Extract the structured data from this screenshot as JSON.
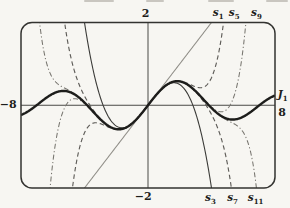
{
  "figure": {
    "caption_hint": "Bessel function J1 and its polynomial approximations",
    "colors": {
      "paper": "#f7f6f2",
      "frame": "#333330",
      "axis": "#4a4a47",
      "ink": "#1d1d1b",
      "thin_ink": "#3b3b38",
      "mid_ink": "#5f5d59",
      "dashdot_ink": "#77756f",
      "light_ink": "#908e88"
    }
  },
  "chart_data": {
    "type": "line",
    "xlabel": "",
    "ylabel": "",
    "x_range": [
      -8,
      8
    ],
    "y_range": [
      -2,
      2
    ],
    "grid": false,
    "legend_position": "none",
    "formula": "s_(2m+1)(x) = sum_{k=0..m} (-1)^k (x/2)^(2k+1) / (k! (k+1)!);  J1 = limit m->inf",
    "series": [
      {
        "id": "s1",
        "label": {
          "base": "s",
          "sub": "1"
        },
        "kind": "partial-sum",
        "terms": 1,
        "style": "solid-light"
      },
      {
        "id": "s3",
        "label": {
          "base": "s",
          "sub": "3"
        },
        "kind": "partial-sum",
        "terms": 2,
        "style": "solid-thin"
      },
      {
        "id": "s5",
        "label": {
          "base": "s",
          "sub": "5"
        },
        "kind": "partial-sum",
        "terms": 3,
        "style": "dashed"
      },
      {
        "id": "s7",
        "label": {
          "base": "s",
          "sub": "7"
        },
        "kind": "partial-sum",
        "terms": 4,
        "style": "dashed"
      },
      {
        "id": "s9",
        "label": {
          "base": "s",
          "sub": "9"
        },
        "kind": "partial-sum",
        "terms": 5,
        "style": "dashdot"
      },
      {
        "id": "s11",
        "label": {
          "base": "s",
          "sub": "11"
        },
        "kind": "partial-sum",
        "terms": 6,
        "style": "dashdot"
      },
      {
        "id": "J1",
        "label": {
          "base": "J",
          "sub": "1"
        },
        "kind": "bessel-j1",
        "terms": 30,
        "style": "solid-bold"
      }
    ],
    "key_values": {
      "J1_at_8": 0.2346,
      "J1_max": {
        "x": 1.84,
        "y": 0.5819
      },
      "J1_zeros": [
        -7.02,
        -3.83,
        0,
        3.83,
        7.02
      ],
      "s3_exits_frame_at_x": 4.0,
      "s5_exits_frame_at_x": 4.78,
      "s7_exits_frame_at_x": 5.26,
      "s9_exits_frame_at_x": 6.15,
      "s11_exits_frame_at_x": 6.83
    },
    "annotations": [
      {
        "kind": "tick",
        "text": "2",
        "x": -0.16,
        "y": 2.13,
        "anchor": "middle"
      },
      {
        "kind": "tick",
        "text": "−2",
        "x": -0.3,
        "y": -2.28,
        "anchor": "middle"
      },
      {
        "kind": "tick",
        "text": "−8",
        "x": -8.28,
        "y": -0.06,
        "anchor": "end"
      },
      {
        "kind": "tick",
        "text": "8",
        "x": 8.2,
        "y": -0.26,
        "anchor": "start"
      },
      {
        "kind": "series-label",
        "base": "J",
        "sub": "1",
        "x": 8.17,
        "y": 0.17,
        "anchor": "start"
      },
      {
        "kind": "series-label",
        "base": "s",
        "sub": "1",
        "x": 4.42,
        "y": 2.15,
        "anchor": "middle"
      },
      {
        "kind": "series-label",
        "base": "s",
        "sub": "5",
        "x": 5.43,
        "y": 2.15,
        "anchor": "middle"
      },
      {
        "kind": "series-label",
        "base": "s",
        "sub": "9",
        "x": 6.83,
        "y": 2.15,
        "anchor": "middle"
      },
      {
        "kind": "series-label",
        "base": "s",
        "sub": "3",
        "x": 3.93,
        "y": -2.32,
        "anchor": "middle"
      },
      {
        "kind": "series-label",
        "base": "s",
        "sub": "7",
        "x": 5.33,
        "y": -2.32,
        "anchor": "middle"
      },
      {
        "kind": "series-label",
        "base": "s",
        "sub": "11",
        "x": 6.78,
        "y": -2.32,
        "anchor": "middle"
      }
    ]
  }
}
